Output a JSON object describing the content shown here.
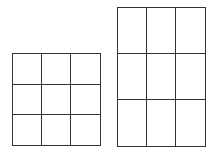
{
  "diagram": {
    "stroke_color": "#333333",
    "background": "#ffffff",
    "grids": [
      {
        "name": "square-grid",
        "rows": 3,
        "cols": 3,
        "x": 12,
        "y": 53,
        "width": 88,
        "height": 92,
        "col_lines": [
          12,
          41,
          70,
          100
        ],
        "row_lines": [
          53,
          84,
          114,
          145
        ]
      },
      {
        "name": "tall-grid",
        "rows": 3,
        "cols": 3,
        "x": 117,
        "y": 7,
        "width": 88,
        "height": 139,
        "col_lines": [
          117,
          146,
          175,
          205
        ],
        "row_lines": [
          7,
          53,
          99,
          146
        ]
      }
    ]
  }
}
